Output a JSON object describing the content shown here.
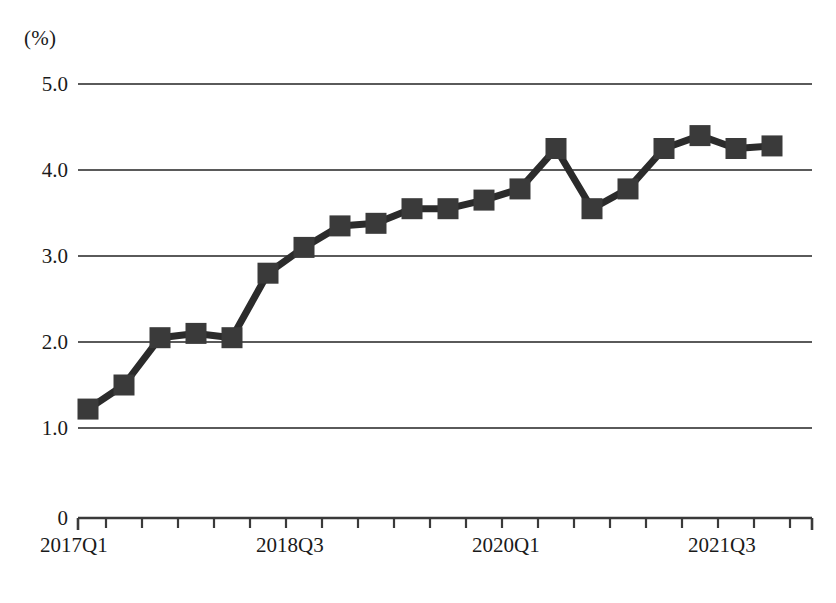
{
  "chart_data": {
    "type": "line",
    "title": "",
    "xlabel": "",
    "ylabel": "(%)",
    "unit_label": "(%)",
    "grid": true,
    "legend": false,
    "ylim": [
      1.0,
      5.0
    ],
    "y_axis_break": true,
    "y_origin_label": "0",
    "y_ticks": [
      {
        "label": "5.0",
        "value": 5.0
      },
      {
        "label": "4.0",
        "value": 4.0
      },
      {
        "label": "3.0",
        "value": 3.0
      },
      {
        "label": "2.0",
        "value": 2.0
      },
      {
        "label": "1.0",
        "value": 1.0
      },
      {
        "label": "0",
        "value": 0
      }
    ],
    "x_tick_labels": [
      "2017Q1",
      "2018Q3",
      "2020Q1",
      "2021Q3"
    ],
    "categories": [
      "2017Q1",
      "2017Q2",
      "2017Q3",
      "2017Q4",
      "2018Q1",
      "2018Q2",
      "2018Q3",
      "2018Q4",
      "2019Q1",
      "2019Q2",
      "2019Q3",
      "2019Q4",
      "2020Q1",
      "2020Q2",
      "2020Q3",
      "2020Q4",
      "2021Q1",
      "2021Q2",
      "2021Q3",
      "2021Q4"
    ],
    "values": [
      1.22,
      1.5,
      2.05,
      2.1,
      2.05,
      2.8,
      3.1,
      3.35,
      3.38,
      3.55,
      3.55,
      3.65,
      3.78,
      4.25,
      3.55,
      3.78,
      4.25,
      4.4,
      4.25,
      4.28
    ],
    "series": [
      {
        "name": "series-1",
        "values": [
          1.22,
          1.5,
          2.05,
          2.1,
          2.05,
          2.8,
          3.1,
          3.35,
          3.38,
          3.55,
          3.55,
          3.65,
          3.78,
          4.25,
          3.55,
          3.78,
          4.25,
          4.4,
          4.25,
          4.28
        ]
      }
    ],
    "marker": "square",
    "colors": {
      "line": "#2b2b2b",
      "marker": "#3a3a3a",
      "grid": "#5a5a5a",
      "axis": "#3a3a3a",
      "background": "#ffffff"
    }
  },
  "caption": {
    "text": ""
  }
}
